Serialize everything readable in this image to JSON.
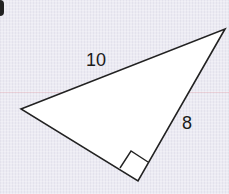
{
  "diagram": {
    "type": "right-triangle",
    "labels": {
      "hypotenuse": "10",
      "leg": "8"
    },
    "right_angle_marker": true,
    "vertices": {
      "left": [
        21,
        109
      ],
      "top_right": [
        225,
        29
      ],
      "bottom_right_angle": [
        138,
        181
      ]
    },
    "colors": {
      "stroke": "#222222",
      "fill": "#ffffff",
      "background": "#ecebf3"
    }
  }
}
